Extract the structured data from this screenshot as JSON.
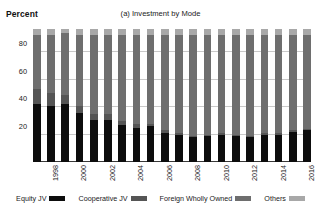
{
  "axis": {
    "ylabel": "Percent",
    "yticks": [
      "20",
      "40",
      "60",
      "80"
    ]
  },
  "title": "(a) Investment by Mode",
  "legend": {
    "items": [
      {
        "label": "Equity JV",
        "color": "#0d0d0d",
        "icon": "legend-swatch-icon"
      },
      {
        "label": "Cooperative JV",
        "color": "#555555",
        "icon": "legend-swatch-icon"
      },
      {
        "label": "Foreign Wholly Owned",
        "color": "#6e6e6e",
        "icon": "legend-swatch-icon"
      },
      {
        "label": "Others",
        "color": "#a8a8a8",
        "icon": "legend-swatch-icon"
      }
    ]
  },
  "xlabels": [
    "",
    "1998",
    "",
    "2000",
    "",
    "2002",
    "",
    "2004",
    "",
    "2006",
    "",
    "2008",
    "",
    "2010",
    "",
    "2012",
    "",
    "2014",
    "",
    "2016"
  ],
  "chart_data": {
    "type": "bar",
    "subtype": "stacked-bar-100",
    "title": "(a) Investment by Mode",
    "xlabel": "",
    "ylabel": "Percent",
    "ylim": [
      0,
      100
    ],
    "yticks": [
      20,
      40,
      60,
      80
    ],
    "grid": true,
    "legend_position": "bottom",
    "categories": [
      "1997",
      "1998",
      "1999",
      "2000",
      "2001",
      "2002",
      "2003",
      "2004",
      "2005",
      "2006",
      "2007",
      "2008",
      "2009",
      "2010",
      "2011",
      "2012",
      "2013",
      "2014",
      "2015",
      "2016"
    ],
    "series": [
      {
        "name": "Equity JV",
        "color": "#0d0d0d",
        "values": [
          42,
          41,
          42,
          36,
          31,
          31,
          27,
          25,
          26,
          21,
          20,
          18,
          19,
          20,
          19,
          18,
          20,
          20,
          22,
          23
        ]
      },
      {
        "name": "Cooperative JV",
        "color": "#555555",
        "values": [
          11,
          9,
          7,
          5,
          4,
          4,
          3,
          3,
          2,
          2,
          1,
          1,
          1,
          1,
          1,
          1,
          1,
          1,
          1,
          1
        ]
      },
      {
        "name": "Foreign Wholly Owned",
        "color": "#6e6e6e",
        "values": [
          40,
          43,
          45,
          52,
          58,
          58,
          63,
          65,
          65,
          70,
          72,
          74,
          73,
          72,
          73,
          74,
          72,
          72,
          70,
          69
        ]
      },
      {
        "name": "Others",
        "color": "#a8a8a8",
        "values": [
          4,
          4,
          3,
          4,
          4,
          4,
          4,
          4,
          4,
          4,
          4,
          4,
          4,
          4,
          4,
          4,
          4,
          4,
          4,
          4
        ]
      }
    ],
    "plot_top_value": 97
  }
}
